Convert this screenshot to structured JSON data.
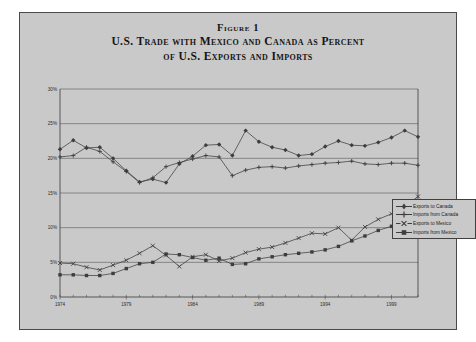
{
  "figure": {
    "label": "Figure 1",
    "title_line1": "U.S. Trade with Mexico and Canada as Percent",
    "title_line2": "of U.S. Exports and Imports"
  },
  "legend": {
    "position": "right",
    "items": [
      {
        "label": "Exports to Canada",
        "marker": "diamond-plus-marker"
      },
      {
        "label": "Imports from Canada",
        "marker": "plus-marker"
      },
      {
        "label": "Exports to Mexico",
        "marker": "x-marker"
      },
      {
        "label": "Imports from Mexico",
        "marker": "square-marker"
      }
    ]
  },
  "chart_data": {
    "type": "line",
    "title": "U.S. Trade with Mexico and Canada as Percent of U.S. Exports and Imports",
    "xlabel": "",
    "ylabel": "",
    "grid": true,
    "legend_position": "right",
    "ylim": [
      0,
      30
    ],
    "yticks": [
      0,
      5,
      10,
      15,
      20,
      25,
      30
    ],
    "ytick_labels": [
      "0%",
      "5%",
      "10%",
      "15%",
      "20%",
      "25%",
      "30%"
    ],
    "xlim": [
      1974,
      2001
    ],
    "xticks": [
      1974,
      1979,
      1984,
      1989,
      1994,
      1999
    ],
    "xtick_labels": [
      "1974",
      "1979",
      "1984",
      "1989",
      "1994",
      "1999"
    ],
    "x": [
      1974,
      1975,
      1976,
      1977,
      1978,
      1979,
      1980,
      1981,
      1982,
      1983,
      1984,
      1985,
      1986,
      1987,
      1988,
      1989,
      1990,
      1991,
      1992,
      1993,
      1994,
      1995,
      1996,
      1997,
      1998,
      1999,
      2000,
      2001
    ],
    "series": [
      {
        "name": "Exports to Canada",
        "marker": "diamond-plus-marker",
        "values": [
          21.3,
          22.6,
          21.5,
          21.6,
          20.0,
          18.2,
          16.6,
          17.0,
          16.5,
          19.2,
          20.3,
          21.9,
          22.0,
          20.4,
          24.0,
          22.4,
          21.6,
          21.2,
          20.4,
          20.6,
          21.7,
          22.5,
          21.9,
          21.8,
          22.3,
          23.0,
          24.0,
          23.1
        ]
      },
      {
        "name": "Imports from Canada",
        "marker": "plus-marker",
        "values": [
          20.2,
          20.4,
          21.6,
          21.0,
          19.5,
          18.1,
          16.5,
          17.2,
          18.8,
          19.4,
          19.9,
          20.4,
          20.2,
          17.5,
          18.3,
          18.7,
          18.8,
          18.6,
          18.9,
          19.1,
          19.3,
          19.4,
          19.6,
          19.2,
          19.1,
          19.3,
          19.3,
          19.0
        ]
      },
      {
        "name": "Exports to Mexico",
        "marker": "x-marker",
        "values": [
          4.9,
          4.8,
          4.3,
          3.9,
          4.6,
          5.3,
          6.3,
          7.4,
          6.0,
          4.4,
          5.8,
          6.1,
          5.2,
          5.6,
          6.4,
          6.9,
          7.2,
          7.8,
          8.5,
          9.2,
          9.1,
          10.0,
          8.2,
          10.1,
          11.2,
          12.0,
          13.0,
          14.5
        ]
      },
      {
        "name": "Imports from Mexico",
        "marker": "square-marker",
        "values": [
          3.2,
          3.2,
          3.1,
          3.1,
          3.4,
          4.1,
          4.8,
          5.0,
          6.2,
          6.1,
          5.7,
          5.3,
          5.6,
          4.7,
          4.8,
          5.5,
          5.8,
          6.1,
          6.3,
          6.5,
          6.8,
          7.3,
          8.1,
          8.8,
          9.6,
          10.2,
          10.4,
          11.1
        ]
      }
    ]
  }
}
